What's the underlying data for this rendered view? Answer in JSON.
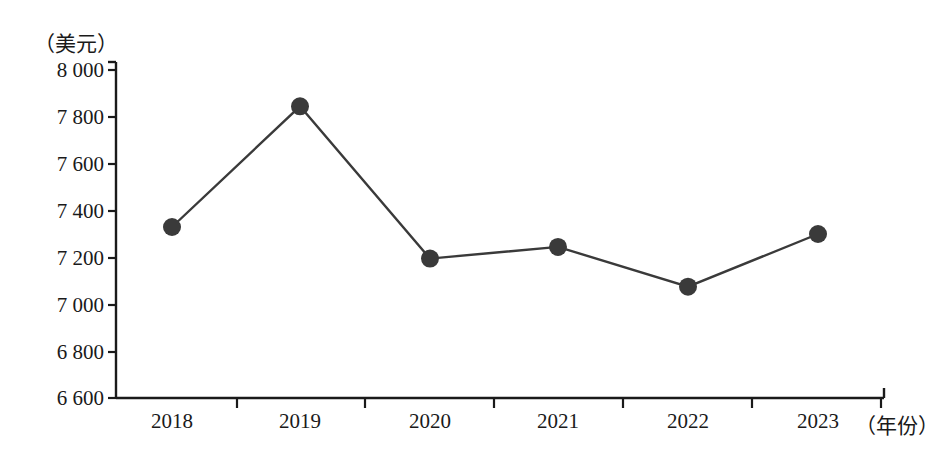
{
  "chart_data": {
    "type": "line",
    "title": "",
    "xlabel": "（年份）",
    "ylabel": "（美元）",
    "categories": [
      "2018",
      "2019",
      "2020",
      "2021",
      "2022",
      "2023"
    ],
    "values": [
      7330,
      7845,
      7195,
      7245,
      7075,
      7300
    ],
    "series": [
      {
        "name": "",
        "values": [
          7330,
          7845,
          7195,
          7245,
          7075,
          7300
        ]
      }
    ],
    "ylim": [
      6600,
      8000
    ],
    "ytick_labels": [
      "8 000",
      "7 800",
      "7 600",
      "7 400",
      "7 200",
      "7 000",
      "6 800",
      "6 600"
    ],
    "ytick_values": [
      8000,
      7800,
      7600,
      7400,
      7200,
      7000,
      6800,
      6600
    ],
    "xtick_labels": [
      "2018",
      "2019",
      "2020",
      "2021",
      "2022",
      "2023"
    ],
    "grid": false,
    "legend": "none",
    "marker": "filled-circle",
    "line_color": "#3a3a3a",
    "marker_color": "#3a3a3a",
    "axis_color": "#1a1a1a"
  },
  "axes": {
    "y_unit": "（美元）",
    "x_unit": "（年份）"
  }
}
